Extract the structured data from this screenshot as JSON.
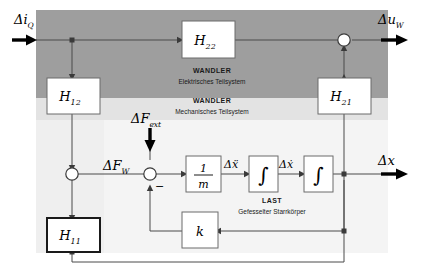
{
  "diagram": {
    "regions": [
      {
        "id": "electrical",
        "title": "WANDLER",
        "subtitle": "Elektrisches Teilsystem",
        "color": "#9e9e9e"
      },
      {
        "id": "mechanical",
        "title": "WANDLER",
        "subtitle": "Mechanisches Teilsystem",
        "color": "#e0e0e0"
      },
      {
        "id": "load",
        "title": "LAST",
        "subtitle": "Gefesselter Starrkörper",
        "color": "#f2f2f2"
      }
    ],
    "blocks": [
      {
        "id": "h22",
        "label": "H",
        "sub": "22"
      },
      {
        "id": "h12",
        "label": "H",
        "sub": "12"
      },
      {
        "id": "h21",
        "label": "H",
        "sub": "21"
      },
      {
        "id": "h11",
        "label": "H",
        "sub": "11"
      },
      {
        "id": "mass",
        "label": "1",
        "denominator": "m"
      },
      {
        "id": "integrator1",
        "label": "∫"
      },
      {
        "id": "integrator2",
        "label": "∫"
      },
      {
        "id": "stiffness",
        "label": "k"
      }
    ],
    "signals": [
      {
        "id": "input-current",
        "symbol": "Δi",
        "sub": "Q"
      },
      {
        "id": "output-voltage",
        "symbol": "Δu",
        "sub": "W"
      },
      {
        "id": "force-winding",
        "symbol": "ΔF",
        "sub": "W"
      },
      {
        "id": "force-external",
        "symbol": "ΔF",
        "sub": "ext"
      },
      {
        "id": "acceleration",
        "symbol": "Δẍ"
      },
      {
        "id": "velocity",
        "symbol": "Δẋ"
      },
      {
        "id": "displacement",
        "symbol": "Δx"
      }
    ],
    "sum_signs": {
      "negative": "−"
    }
  }
}
